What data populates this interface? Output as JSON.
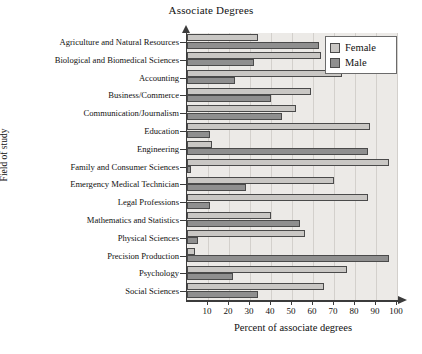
{
  "chart_data": {
    "type": "bar",
    "orientation": "horizontal",
    "title": "Associate Degrees",
    "xlabel": "Percent of associate degrees",
    "ylabel": "Field of study",
    "xlim": [
      0,
      100
    ],
    "xticks": [
      10,
      20,
      30,
      40,
      50,
      60,
      70,
      80,
      90,
      100
    ],
    "grid": true,
    "legend_position": "top-right",
    "categories": [
      "Agriculture and Natural Resources",
      "Biological and Biomedical Sciences",
      "Accounting",
      "Business/Commerce",
      "Communication/Journalism",
      "Education",
      "Engineering",
      "Family and Consumer Sciences",
      "Emergency Medical Technician",
      "Legal Professions",
      "Mathematics and Statistics",
      "Physical Sciences",
      "Precision Production",
      "Psychology",
      "Social Sciences"
    ],
    "series": [
      {
        "name": "Female",
        "color": "#c9c7c4",
        "values": [
          34,
          64,
          74,
          59,
          52,
          87,
          12,
          96,
          70,
          86,
          40,
          56,
          4,
          76,
          65
        ]
      },
      {
        "name": "Male",
        "color": "#8f8f8f",
        "values": [
          63,
          32,
          23,
          40,
          45,
          11,
          86,
          2,
          28,
          11,
          54,
          5,
          96,
          22,
          34
        ]
      }
    ]
  },
  "legend": {
    "items": [
      {
        "label": "Female",
        "swatch": "female"
      },
      {
        "label": "Male",
        "swatch": "male"
      }
    ]
  }
}
